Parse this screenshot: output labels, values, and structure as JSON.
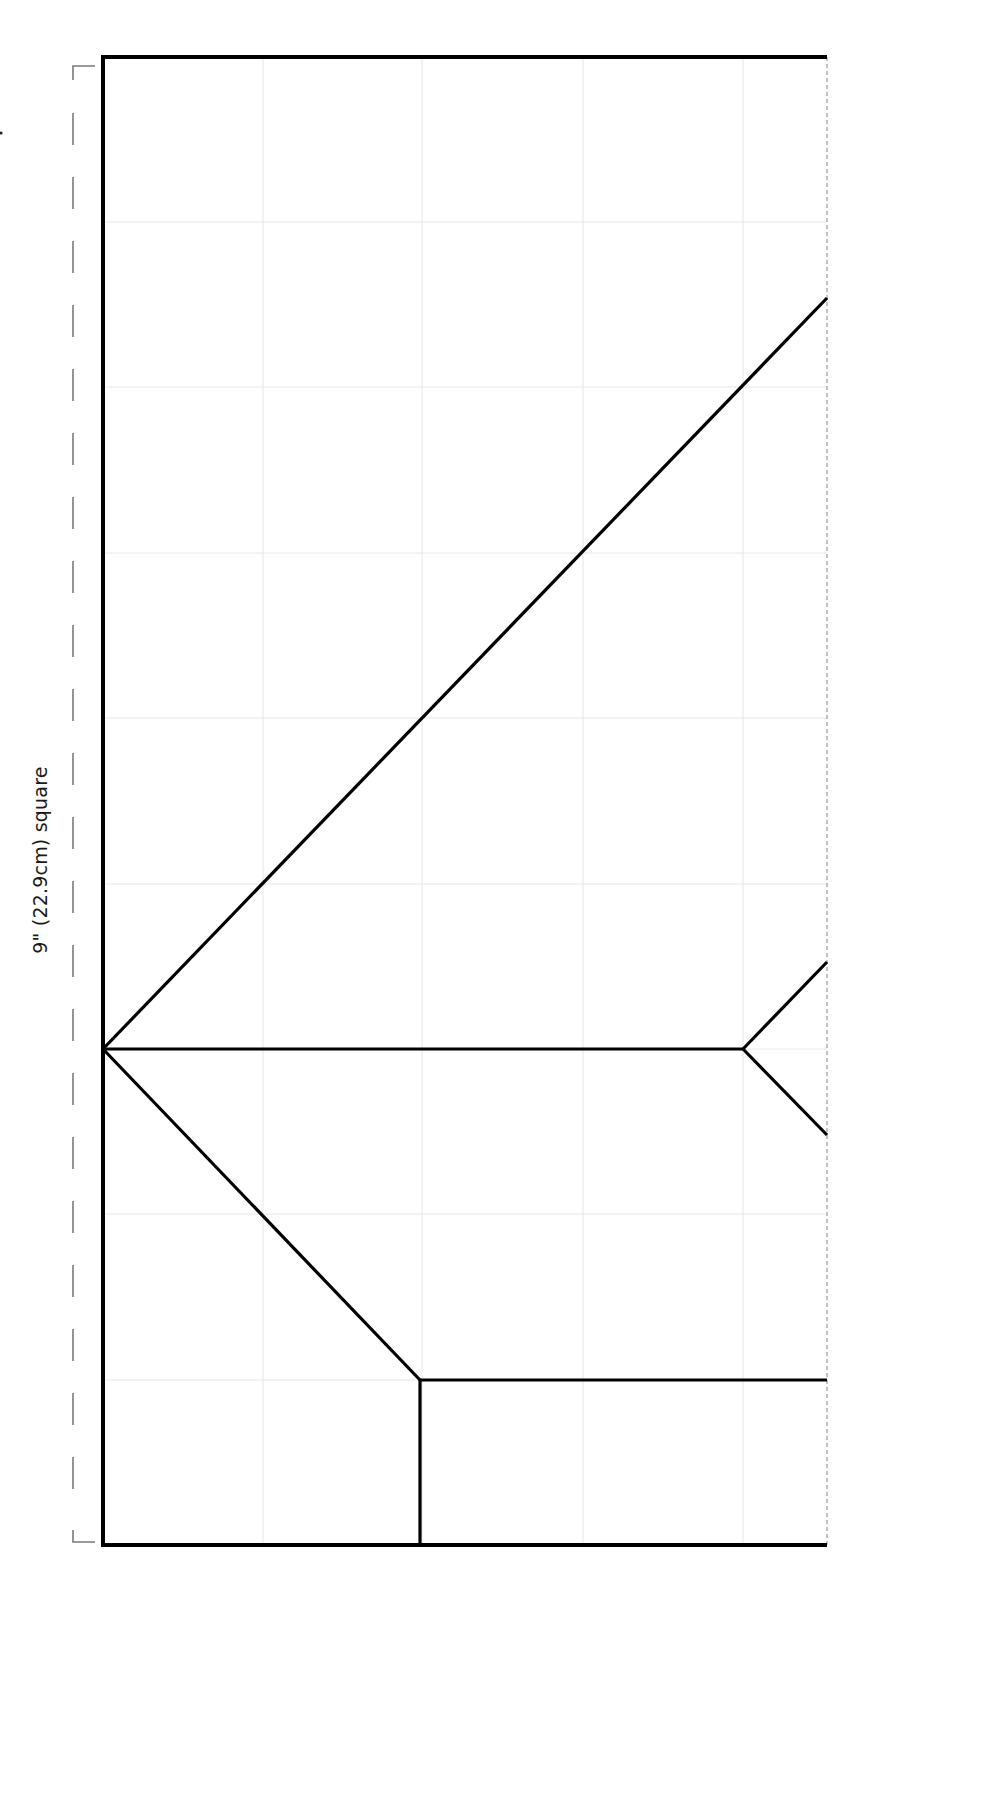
{
  "diagram": {
    "dimension_label": "9\" (22.9cm) square",
    "colors": {
      "fold_line": "#000000",
      "grid_line": "#e6e6e6",
      "dimension_bracket": "#7a7a7a",
      "edge_dashed": "#9a9a9a",
      "background": "#ffffff"
    },
    "frame": {
      "x": 103,
      "y": 57,
      "width": 724,
      "height": 1488
    },
    "grid": {
      "vertical_x": [
        263,
        422,
        583,
        743
      ],
      "horizontal_y": [
        222,
        387,
        553,
        718,
        884,
        1049,
        1214,
        1380
      ]
    },
    "fold_lines": [
      {
        "name": "long-diagonal",
        "x1": 103,
        "y1": 1049,
        "x2": 827,
        "y2": 298
      },
      {
        "name": "center-horizontal",
        "x1": 103,
        "y1": 1049,
        "x2": 743,
        "y2": 1049
      },
      {
        "name": "arrow-upper",
        "x1": 743,
        "y1": 1049,
        "x2": 827,
        "y2": 962
      },
      {
        "name": "arrow-lower",
        "x1": 743,
        "y1": 1049,
        "x2": 827,
        "y2": 1135
      },
      {
        "name": "lower-diagonal",
        "x1": 103,
        "y1": 1049,
        "x2": 420,
        "y2": 1380
      },
      {
        "name": "lower-horizontal",
        "x1": 420,
        "y1": 1380,
        "x2": 827,
        "y2": 1380
      },
      {
        "name": "lower-vertical",
        "x1": 420,
        "y1": 1380,
        "x2": 420,
        "y2": 1545
      }
    ],
    "bracket": {
      "x": 73,
      "y1": 57,
      "y2": 1545,
      "tick_len": 22
    }
  }
}
